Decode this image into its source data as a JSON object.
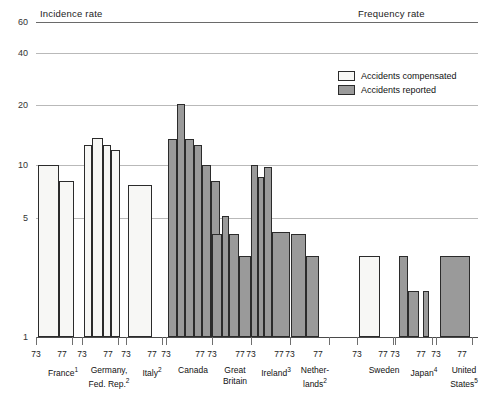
{
  "sections": {
    "left_title": "Incidence rate",
    "right_title": "Frequency rate"
  },
  "legend": {
    "items": [
      {
        "label": "Accidents compensated",
        "style": "white",
        "color": "#f7f7f5"
      },
      {
        "label": "Accidents reported",
        "style": "gray",
        "color": "#9a9a9a"
      }
    ]
  },
  "axis": {
    "ticks": [
      "60",
      "40",
      "20",
      "10",
      "5",
      "1"
    ],
    "scale": "log"
  },
  "year_labels": {
    "start": "73",
    "end": "77"
  },
  "chart_data": {
    "type": "area",
    "title": "",
    "subtitle": "",
    "xlabel": "",
    "ylabel": "",
    "ylim": [
      1,
      60
    ],
    "yscale": "log",
    "ytick_values": [
      1,
      5,
      10,
      20,
      40,
      60
    ],
    "grid": true,
    "legend_position": "top-right",
    "legend_entries": [
      "Accidents compensated",
      "Accidents reported"
    ],
    "annotations": [
      "Incidence rate",
      "Frequency rate"
    ],
    "x_years": [
      1973,
      1974,
      1975,
      1976,
      1977
    ],
    "groups": [
      {
        "country": "France",
        "footnote": "1",
        "section": "Incidence rate",
        "series": "Accidents compensated",
        "fill": "white",
        "values": [
          10.0,
          10.0,
          10.0,
          8.7,
          8.7
        ]
      },
      {
        "country": "Germany, Fed. Rep.",
        "footnote": "2",
        "section": "Incidence rate",
        "series": "Accidents compensated",
        "fill": "white",
        "values": [
          13.0,
          14.0,
          14.0,
          12.7,
          12.3
        ]
      },
      {
        "country": "Italy",
        "footnote": "2",
        "section": "Incidence rate",
        "series": "Accidents compensated",
        "fill": "white",
        "values": [
          8.2,
          8.2,
          8.2,
          8.2,
          8.2
        ]
      },
      {
        "country": "Canada",
        "footnote": "",
        "section": "Incidence rate",
        "series": "Accidents reported",
        "fill": "gray",
        "values": [
          15.0,
          20.5,
          15.0,
          14.0,
          10.0,
          8.7
        ]
      },
      {
        "country": "Great Britain",
        "footnote": "",
        "section": "Incidence rate",
        "series": "Accidents reported",
        "fill": "gray",
        "values": [
          4.3,
          5.2,
          4.3,
          4.3,
          3.3,
          3.3
        ]
      },
      {
        "country": "Ireland",
        "footnote": "3",
        "section": "Incidence rate",
        "series": "Accidents reported",
        "fill": "gray",
        "values": [
          10.0,
          8.8,
          9.9,
          9.5,
          4.5,
          4.5
        ]
      },
      {
        "country": "Netherlands",
        "footnote": "2",
        "section": "Incidence rate",
        "series": "Accidents reported",
        "fill": "gray",
        "values": [
          4.3,
          4.3,
          3.3,
          3.3,
          3.3
        ]
      },
      {
        "country": "Sweden",
        "footnote": "",
        "section": "Frequency rate",
        "series": "Accidents compensated",
        "fill": "white",
        "values": [
          3.3,
          3.3,
          3.3,
          3.3,
          3.3
        ]
      },
      {
        "country": "Japan",
        "footnote": "4",
        "section": "Frequency rate",
        "series": "Accidents reported",
        "fill": "gray",
        "values": [
          3.3,
          2.1,
          2.1,
          2.1,
          2.1
        ]
      },
      {
        "country": "United States",
        "footnote": "5",
        "section": "Frequency rate",
        "series": "Accidents reported",
        "fill": "gray",
        "values": [
          3.3,
          3.3,
          3.3,
          3.3,
          3.3
        ]
      }
    ]
  },
  "layout": {
    "gridlines": [
      {
        "value": "60",
        "y": 22
      },
      {
        "value": "40",
        "y": 53
      },
      {
        "value": "20",
        "y": 105
      },
      {
        "value": "10",
        "y": 165
      },
      {
        "value": "5",
        "y": 218
      },
      {
        "value": "1",
        "y": 337
      }
    ],
    "bars": [
      {
        "group": "France",
        "fill": "white",
        "segs": [
          {
            "x": 38,
            "w": 21,
            "top": 165
          },
          {
            "x": 59,
            "w": 15,
            "top": 181
          }
        ]
      },
      {
        "group": "Germany",
        "fill": "white",
        "segs": [
          {
            "x": 84,
            "w": 8,
            "top": 145
          },
          {
            "x": 92,
            "w": 11,
            "top": 138
          },
          {
            "x": 103,
            "w": 8,
            "top": 145
          },
          {
            "x": 111,
            "w": 9,
            "top": 150
          }
        ]
      },
      {
        "group": "Italy",
        "fill": "white",
        "segs": [
          {
            "x": 128,
            "w": 24,
            "top": 185
          }
        ]
      },
      {
        "group": "Canada",
        "fill": "gray",
        "segs": [
          {
            "x": 168,
            "w": 9,
            "top": 139
          },
          {
            "x": 177,
            "w": 8,
            "top": 104
          },
          {
            "x": 185,
            "w": 9,
            "top": 139
          },
          {
            "x": 194,
            "w": 8,
            "top": 145
          },
          {
            "x": 202,
            "w": 9,
            "top": 165
          },
          {
            "x": 211,
            "w": 9,
            "top": 181
          }
        ]
      },
      {
        "group": "Great Britain",
        "fill": "gray",
        "segs": [
          {
            "x": 212,
            "w": 10,
            "top": 234
          },
          {
            "x": 222,
            "w": 7,
            "top": 216
          },
          {
            "x": 229,
            "w": 10,
            "top": 234
          },
          {
            "x": 239,
            "w": 12,
            "top": 256
          }
        ]
      },
      {
        "group": "Ireland",
        "fill": "gray",
        "segs": [
          {
            "x": 251,
            "w": 7,
            "top": 165
          },
          {
            "x": 258,
            "w": 6,
            "top": 177
          },
          {
            "x": 264,
            "w": 8,
            "top": 167
          },
          {
            "x": 272,
            "w": 18,
            "top": 232
          }
        ]
      },
      {
        "group": "Netherlands",
        "fill": "gray",
        "segs": [
          {
            "x": 291,
            "w": 15,
            "top": 234
          },
          {
            "x": 306,
            "w": 13,
            "top": 256
          }
        ]
      },
      {
        "group": "Sweden",
        "fill": "white",
        "segs": [
          {
            "x": 359,
            "w": 21,
            "top": 256
          }
        ]
      },
      {
        "group": "Japan",
        "fill": "gray",
        "segs": [
          {
            "x": 399,
            "w": 9,
            "top": 256
          },
          {
            "x": 408,
            "w": 11,
            "top": 291
          },
          {
            "x": 423,
            "w": 6,
            "top": 291
          }
        ]
      },
      {
        "group": "United States",
        "fill": "gray",
        "segs": [
          {
            "x": 440,
            "w": 30,
            "top": 256
          }
        ]
      }
    ],
    "ticks_x": [
      36,
      72,
      82,
      118,
      126,
      162,
      166,
      212,
      212,
      251,
      251,
      290,
      290,
      329,
      357,
      393,
      395,
      432,
      436,
      472
    ],
    "year_label_positions": [
      {
        "x": 36,
        "label": "73"
      },
      {
        "x": 62,
        "label": "77"
      },
      {
        "x": 82,
        "label": "73"
      },
      {
        "x": 108,
        "label": "77"
      },
      {
        "x": 126,
        "label": "73"
      },
      {
        "x": 152,
        "label": "77"
      },
      {
        "x": 166,
        "label": "73"
      },
      {
        "x": 200,
        "label": "77"
      },
      {
        "x": 212,
        "label": "73"
      },
      {
        "x": 240,
        "label": "77"
      },
      {
        "x": 251,
        "label": "73"
      },
      {
        "x": 279,
        "label": "77"
      },
      {
        "x": 290,
        "label": "73"
      },
      {
        "x": 318,
        "label": "77"
      },
      {
        "x": 357,
        "label": "73"
      },
      {
        "x": 383,
        "label": "77"
      },
      {
        "x": 395,
        "label": "73"
      },
      {
        "x": 421,
        "label": "77"
      },
      {
        "x": 436,
        "label": "73"
      },
      {
        "x": 462,
        "label": "77"
      }
    ],
    "country_label_positions": [
      {
        "x": 28,
        "w": 70,
        "name": "France",
        "fn": "1"
      },
      {
        "x": 74,
        "w": 70,
        "name": "Germany,<br>Fed. Rep.",
        "fn": "2"
      },
      {
        "x": 118,
        "w": 68,
        "name": "Italy",
        "fn": "2"
      },
      {
        "x": 156,
        "w": 74,
        "name": "Canada",
        "fn": ""
      },
      {
        "x": 200,
        "w": 70,
        "name": "Great<br>Britain",
        "fn": ""
      },
      {
        "x": 240,
        "w": 72,
        "name": "Ireland",
        "fn": "3"
      },
      {
        "x": 280,
        "w": 70,
        "name": "Nether-<br>lands",
        "fn": "2"
      },
      {
        "x": 348,
        "w": 72,
        "name": "Sweden",
        "fn": ""
      },
      {
        "x": 389,
        "w": 70,
        "name": "Japan",
        "fn": "4"
      },
      {
        "x": 428,
        "w": 72,
        "name": "United<br>States",
        "fn": "5"
      }
    ]
  }
}
